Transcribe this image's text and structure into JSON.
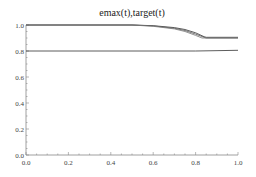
{
  "chart_data": {
    "type": "line",
    "title": "emax(t),target(t)",
    "xlabel": "",
    "ylabel": "",
    "xlim": [
      0.0,
      1.0
    ],
    "ylim": [
      0.0,
      1.0
    ],
    "x_ticks": [
      "0.0",
      "0.2",
      "0.4",
      "0.6",
      "0.8",
      "1.0"
    ],
    "y_ticks": [
      "0.0",
      "0.2",
      "0.4",
      "0.6",
      "0.8",
      "1.0"
    ],
    "grid": false,
    "legend": [],
    "series": [
      {
        "name": "emax 1",
        "color": "#333333",
        "x": [
          0.0,
          0.5,
          0.6,
          0.7,
          0.75,
          0.8,
          0.84,
          0.85,
          1.0
        ],
        "y": [
          1.0,
          1.0,
          0.995,
          0.98,
          0.965,
          0.94,
          0.91,
          0.905,
          0.905
        ]
      },
      {
        "name": "emax 2",
        "color": "#555555",
        "x": [
          0.0,
          0.5,
          0.6,
          0.7,
          0.75,
          0.8,
          0.84,
          0.85,
          1.0
        ],
        "y": [
          1.0,
          1.0,
          0.993,
          0.975,
          0.958,
          0.93,
          0.905,
          0.9,
          0.9
        ]
      },
      {
        "name": "emax 3",
        "color": "#777777",
        "x": [
          0.0,
          0.5,
          0.6,
          0.7,
          0.75,
          0.8,
          0.83,
          0.85,
          1.0
        ],
        "y": [
          1.0,
          1.0,
          0.99,
          0.97,
          0.95,
          0.92,
          0.9,
          0.9,
          0.9
        ]
      },
      {
        "name": "target",
        "color": "#333333",
        "x": [
          0.0,
          0.8,
          1.0
        ],
        "y": [
          0.8,
          0.8,
          0.805
        ]
      }
    ]
  }
}
